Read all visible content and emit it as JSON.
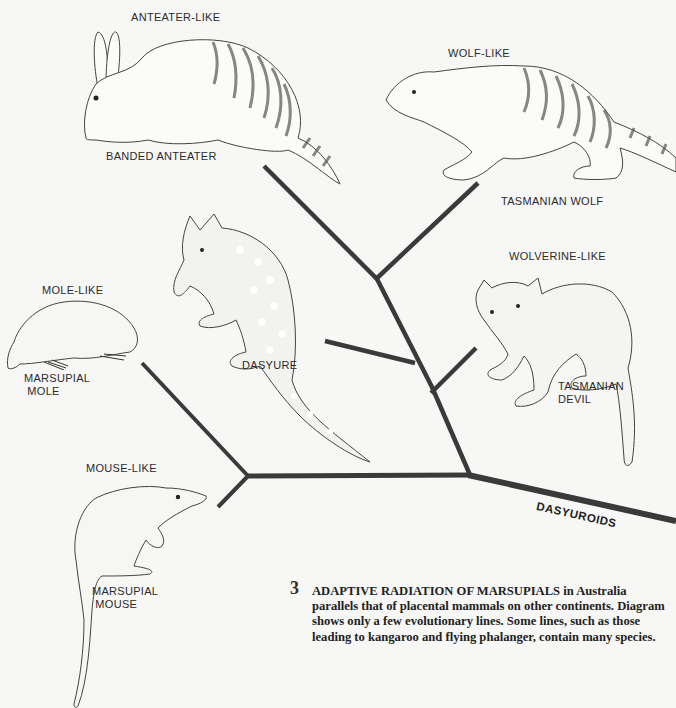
{
  "figure": {
    "number": "3",
    "caption_title": "ADAPTIVE RADIATION OF MARSUPIALS",
    "caption_body": "in Australia parallels that of placental mammals on other continents. Diagram shows only a few evolutionary lines. Some lines, such as those leading to kangaroo and flying phalanger, contain many species."
  },
  "tree": {
    "group_label": "DASYUROIDS",
    "line_color": "#3a3a3a"
  },
  "animals": [
    {
      "id": "banded-anteater",
      "niche": "ANTEATER-LIKE",
      "name": "BANDED ANTEATER"
    },
    {
      "id": "tasmanian-wolf",
      "niche": "WOLF-LIKE",
      "name": "TASMANIAN WOLF"
    },
    {
      "id": "dasyure",
      "niche": "",
      "name": "DASYURE"
    },
    {
      "id": "tasmanian-devil",
      "niche": "WOLVERINE-LIKE",
      "name": "TASMANIAN\nDEVIL"
    },
    {
      "id": "marsupial-mole",
      "niche": "MOLE-LIKE",
      "name": "MARSUPIAL\n MOLE"
    },
    {
      "id": "marsupial-mouse",
      "niche": "MOUSE-LIKE",
      "name": "MARSUPIAL\n MOUSE"
    }
  ]
}
